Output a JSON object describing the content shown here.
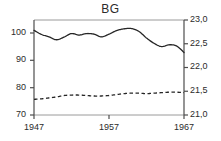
{
  "chart_data": {
    "type": "line",
    "title": "BG",
    "xlabel": "",
    "ylabel": "",
    "grid": false,
    "legend": "none",
    "x": [
      1947,
      1948,
      1949,
      1950,
      1951,
      1952,
      1953,
      1954,
      1955,
      1956,
      1957,
      1958,
      1959,
      1960,
      1961,
      1962,
      1963,
      1964,
      1965,
      1966,
      1967
    ],
    "x_axis": {
      "min": 1947,
      "max": 1967,
      "tick_labels": [
        "1947",
        "1957",
        "1967"
      ],
      "tick_values": [
        1947,
        1957,
        1967
      ]
    },
    "y_axis_left": {
      "min": 70,
      "max": 102.2,
      "tick_labels": [
        "100",
        "90",
        "80",
        "70"
      ],
      "tick_values": [
        100,
        90,
        80,
        70
      ],
      "position": "left"
    },
    "y_axis_right": {
      "min": 21.0,
      "max": 23.0,
      "tick_labels": [
        "23,0",
        "22,5",
        "22,0",
        "21,5",
        "21,0"
      ],
      "tick_values": [
        23.0,
        22.5,
        22.0,
        21.5,
        21.0
      ],
      "position": "right"
    },
    "series": [
      {
        "name": "solid-series",
        "style": "solid",
        "axis": "left",
        "color": "#262626",
        "values": [
          98.7,
          97.3,
          96.5,
          95.5,
          96.4,
          97.6,
          97.1,
          97.6,
          97.4,
          96.5,
          97.4,
          98.6,
          99.2,
          99.3,
          98.3,
          96.1,
          94.3,
          93.2,
          93.8,
          93.4,
          91.2
        ]
      },
      {
        "name": "dashed-series",
        "style": "dashed",
        "axis": "right",
        "color": "#262626",
        "values": [
          21.33,
          21.34,
          21.36,
          21.38,
          21.41,
          21.42,
          21.42,
          21.41,
          21.4,
          21.4,
          21.41,
          21.43,
          21.45,
          21.46,
          21.46,
          21.45,
          21.46,
          21.47,
          21.48,
          21.48,
          21.47
        ]
      }
    ]
  },
  "colors": {
    "axis": "#6e6e6e",
    "line": "#262626",
    "text": "#2b2b2b",
    "background": "#ffffff"
  }
}
